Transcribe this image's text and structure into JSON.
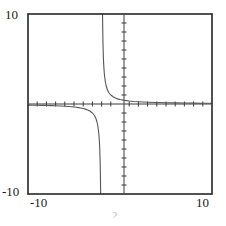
{
  "figure": {
    "kind": "function-plot",
    "background_color": "#ffffff",
    "frame": {
      "x": 28,
      "y": 14,
      "width": 184,
      "height": 180,
      "stroke_color": "#262626",
      "stroke_width": 1.6
    },
    "axes": {
      "x_axis_pixel_y": 104,
      "y_axis_pixel_x": 124,
      "stroke_color": "#3a3a3a",
      "stroke_width": 1,
      "tick_length": 5,
      "tick_step": 1,
      "show_grid": false
    },
    "curve": {
      "stroke_color": "#555555",
      "stroke_width": 1.1
    },
    "partial_caption": "2"
  },
  "labels": {
    "y_max": "10",
    "y_min": "-10",
    "x_min": "-10",
    "x_max": "10"
  },
  "chart_data": {
    "type": "line",
    "title": "",
    "subtitle": "",
    "xlabel": "",
    "ylabel": "",
    "xlim": [
      -10,
      10
    ],
    "ylim": [
      -10,
      10
    ],
    "xticks": [
      -10,
      -9,
      -8,
      -7,
      -6,
      -5,
      -4,
      -3,
      -2,
      -1,
      0,
      1,
      2,
      3,
      4,
      5,
      6,
      7,
      8,
      9,
      10
    ],
    "yticks": [
      -10,
      -9,
      -8,
      -7,
      -6,
      -5,
      -4,
      -3,
      -2,
      -1,
      0,
      1,
      2,
      3,
      4,
      5,
      6,
      7,
      8,
      9,
      10
    ],
    "xtick_labels": [
      "-10",
      "10"
    ],
    "ytick_labels": [
      "-10",
      "10"
    ],
    "grid": false,
    "legend": null,
    "annotations": [],
    "asymptotes": {
      "vertical": [
        -2
      ],
      "horizontal": [
        0
      ]
    },
    "series": [
      {
        "name": "left-branch",
        "x": [
          -10,
          -9.5,
          -9,
          -8.5,
          -8,
          -7.5,
          -7,
          -6.5,
          -6,
          -5.5,
          -5,
          -4.75,
          -4.5,
          -4.25,
          -4,
          -3.75,
          -3.5,
          -3.25,
          -3,
          -2.9,
          -2.8,
          -2.7,
          -2.6,
          -2.5,
          -2.4,
          -2.3,
          -2.25,
          -2.2,
          -2.15,
          -2.1
        ],
        "y": [
          -0.125,
          -0.133,
          -0.143,
          -0.154,
          -0.167,
          -0.182,
          -0.2,
          -0.222,
          -0.25,
          -0.286,
          -0.333,
          -0.364,
          -0.4,
          -0.444,
          -0.5,
          -0.571,
          -0.667,
          -0.8,
          -1.0,
          -1.111,
          -1.25,
          -1.429,
          -1.667,
          -2.0,
          -2.5,
          -3.333,
          -4.0,
          -5.0,
          -6.667,
          -10.0
        ]
      },
      {
        "name": "right-branch",
        "x": [
          -1.9,
          -1.85,
          -1.8,
          -1.75,
          -1.7,
          -1.6,
          -1.5,
          -1.4,
          -1.3,
          -1.2,
          -1.1,
          -1.0,
          -0.75,
          -0.5,
          -0.25,
          0,
          0.5,
          1,
          1.5,
          2,
          3,
          4,
          5,
          6,
          7,
          8,
          9,
          10
        ],
        "y": [
          10.0,
          6.667,
          5.0,
          4.0,
          3.333,
          2.5,
          2.0,
          1.667,
          1.429,
          1.25,
          1.111,
          1.0,
          0.8,
          0.667,
          0.571,
          0.5,
          0.4,
          0.333,
          0.286,
          0.25,
          0.2,
          0.167,
          0.143,
          0.125,
          0.111,
          0.1,
          0.091,
          0.083
        ]
      }
    ]
  }
}
